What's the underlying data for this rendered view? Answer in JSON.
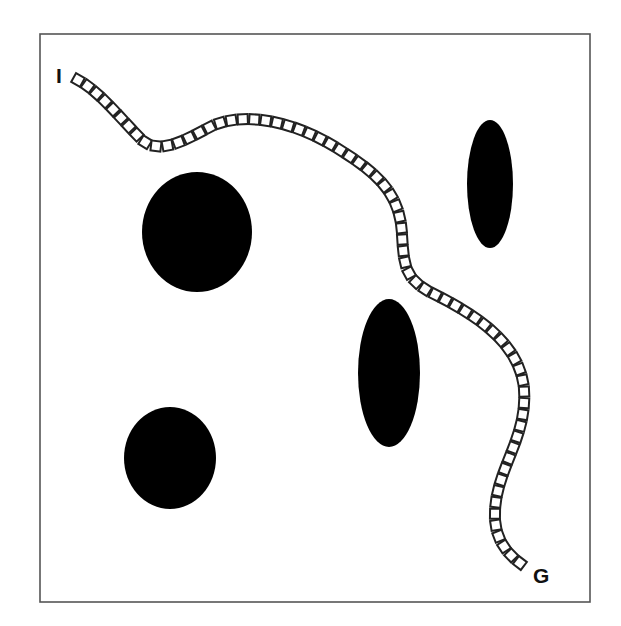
{
  "diagram": {
    "type": "path-planning",
    "frame": {
      "x": 40,
      "y": 34,
      "width": 550,
      "height": 568,
      "stroke": "#555555"
    },
    "labels": {
      "start": {
        "text": "I",
        "x": 56,
        "y": 83
      },
      "goal": {
        "text": "G",
        "x": 533,
        "y": 583
      }
    },
    "obstacles": [
      {
        "id": "obstacle-round-upper-left",
        "cx": 197,
        "cy": 232,
        "rx": 55,
        "ry": 60,
        "fill": "#000000"
      },
      {
        "id": "obstacle-round-lower-left",
        "cx": 170,
        "cy": 458,
        "rx": 46,
        "ry": 51,
        "fill": "#000000"
      },
      {
        "id": "obstacle-ellipse-center",
        "cx": 389,
        "cy": 373,
        "rx": 31,
        "ry": 74,
        "fill": "#000000"
      },
      {
        "id": "obstacle-ellipse-upper-right",
        "cx": 490,
        "cy": 184,
        "rx": 23,
        "ry": 64,
        "fill": "#000000"
      }
    ],
    "path": {
      "d": "M 78 80 C 100 92, 120 118, 142 140 C 160 155, 185 140, 210 127 C 240 112, 290 118, 340 150 C 380 175, 400 195, 402 235 C 404 265, 405 278, 430 292 C 470 312, 520 340, 524 390 C 527 440, 495 470, 495 515 C 495 540, 508 555, 524 566",
      "square_size": 10,
      "spacing": 11.5,
      "stroke": "#222222",
      "fill": "#ffffff"
    }
  }
}
